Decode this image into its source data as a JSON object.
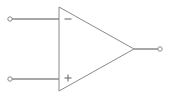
{
  "diagram": {
    "background_color": "#ffffff",
    "line_color": "#8a8a8a",
    "sign_color": "#6e6e6e",
    "terminal_fill": "#ffffff",
    "line_width": 1,
    "body": {
      "shape": "triangle",
      "label": "op-amp-body",
      "apex_left_top": [
        59,
        7
      ],
      "apex_left_bottom": [
        59,
        91
      ],
      "apex_right": [
        134,
        49
      ],
      "points": "59,7 134,49 59,91"
    },
    "pins": [
      {
        "name": "inverting-input",
        "symbol": "−",
        "symbol_name": "minus-sign",
        "wire": {
          "x1": 10,
          "y1": 19,
          "x2": 59,
          "y2": 19
        },
        "terminal": {
          "cx": 10,
          "cy": 19,
          "r": 2.2
        },
        "sign_position": {
          "x": 68,
          "y": 19
        },
        "sign_size": {
          "width": 7,
          "height": 1
        }
      },
      {
        "name": "non-inverting-input",
        "symbol": "+",
        "symbol_name": "plus-sign",
        "wire": {
          "x1": 10,
          "y1": 79,
          "x2": 59,
          "y2": 79
        },
        "terminal": {
          "cx": 10,
          "cy": 79,
          "r": 2.2
        },
        "sign_position": {
          "x": 68,
          "y": 78
        },
        "sign_size": {
          "width": 7,
          "height": 7
        }
      },
      {
        "name": "output",
        "symbol": "",
        "symbol_name": "output-node",
        "wire": {
          "x1": 134,
          "y1": 49,
          "x2": 159,
          "y2": 49
        },
        "terminal": {
          "cx": 160,
          "cy": 49,
          "r": 2.2
        },
        "sign_position": null,
        "sign_size": null
      }
    ]
  }
}
